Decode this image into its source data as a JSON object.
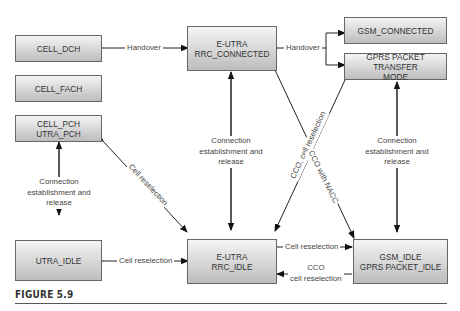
{
  "figure": {
    "caption": "FIGURE 5.9",
    "states": {
      "cell_dch": "CELL_DCH",
      "cell_fach": "CELL_FACH",
      "cell_pch_l1": "CELL_PCH",
      "cell_pch_l2": "UTRA_PCH",
      "utra_idle": "UTRA_IDLE",
      "eutra_connected_l1": "E-UTRA",
      "eutra_connected_l2": "RRC_CONNECTED",
      "eutra_idle_l1": "E-UTRA",
      "eutra_idle_l2": "RRC_IDLE",
      "gsm_connected": "GSM_CONNECTED",
      "gprs_transfer_l1": "GPRS PACKET TRANSFER",
      "gprs_transfer_l2": "MODE",
      "gsm_idle_l1": "GSM_IDLE",
      "gsm_idle_l2": "GPRS PACKET_IDLE"
    },
    "transitions": {
      "handover_left": "Handover",
      "handover_right": "Handover",
      "conn_left_l1": "Connection",
      "conn_left_l2": "establishment and",
      "conn_left_l3": "release",
      "conn_mid_l1": "Connection",
      "conn_mid_l2": "establishment and",
      "conn_mid_l3": "release",
      "conn_right_l1": "Connection",
      "conn_right_l2": "establishment and",
      "conn_right_l3": "release",
      "cell_resel_diag": "Cell reselection",
      "cell_resel_bottom_left": "Cell reselection",
      "cell_resel_bottom_right": "Cell reselection",
      "cco_cell_resel_diag": "CCO, cell reselection",
      "cco_nacc_diag": "CCO with NACC",
      "cco_bottom_l1": "CCO",
      "cco_bottom_l2": "cell reselection"
    }
  }
}
